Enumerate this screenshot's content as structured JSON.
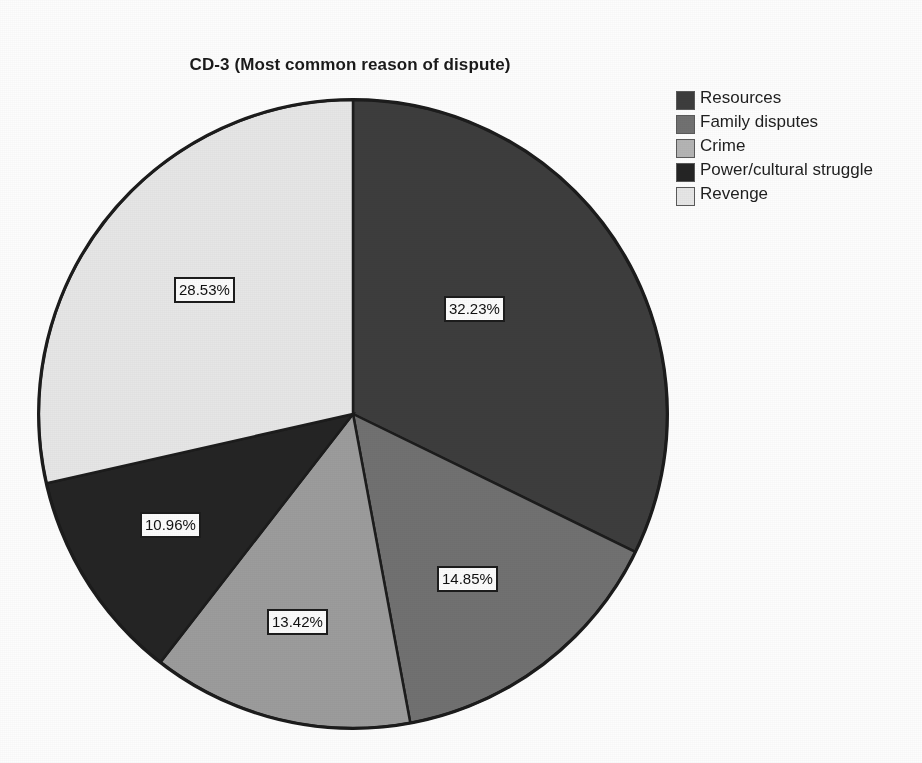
{
  "chart_data": {
    "type": "pie",
    "title": "CD-3 (Most common reason of dispute)",
    "xlabel": "",
    "ylabel": "",
    "legend_position": "top-right",
    "grid": false,
    "categories": [
      "Resources",
      "Family disputes",
      "Crime",
      "Power/cultural struggle",
      "Revenge"
    ],
    "values": [
      32.23,
      14.85,
      13.42,
      10.96,
      28.53
    ],
    "value_labels": [
      "32.23%",
      "14.85%",
      "13.42%",
      "10.96%",
      "28.53%"
    ],
    "units": "percent",
    "start_angle_deg": 0,
    "direction": "clockwise",
    "slices": [
      {
        "name": "Resources",
        "value": 32.23,
        "label": "32.23%",
        "color": "#3d3d3d",
        "start_deg": 0.0,
        "end_deg": 116.03
      },
      {
        "name": "Family disputes",
        "value": 14.85,
        "label": "14.85%",
        "color": "#717171",
        "start_deg": 116.03,
        "end_deg": 169.49
      },
      {
        "name": "Crime",
        "value": 13.42,
        "label": "13.42%",
        "color": "#9c9c9c",
        "start_deg": 169.49,
        "end_deg": 217.8
      },
      {
        "name": "Power/cultural struggle",
        "value": 10.96,
        "label": "10.96%",
        "color": "#242424",
        "start_deg": 217.8,
        "end_deg": 257.26
      },
      {
        "name": "Revenge",
        "value": 28.53,
        "label": "28.53%",
        "color": "#e6e6e6",
        "start_deg": 257.26,
        "end_deg": 360.0
      }
    ],
    "total": 99.99
  },
  "legend": {
    "items": [
      {
        "label": "Resources",
        "color": "#3d3d3d"
      },
      {
        "label": "Family disputes",
        "color": "#717171"
      },
      {
        "label": "Crime",
        "color": "#b4b4b4"
      },
      {
        "label": "Power/cultural struggle",
        "color": "#242424"
      },
      {
        "label": "Revenge",
        "color": "#e6e6e6"
      }
    ]
  },
  "colors": {
    "background": "#fdfdfd",
    "outline": "#1c1c1c",
    "text": "#111111",
    "label_box_fill": "#fbfbfb"
  }
}
